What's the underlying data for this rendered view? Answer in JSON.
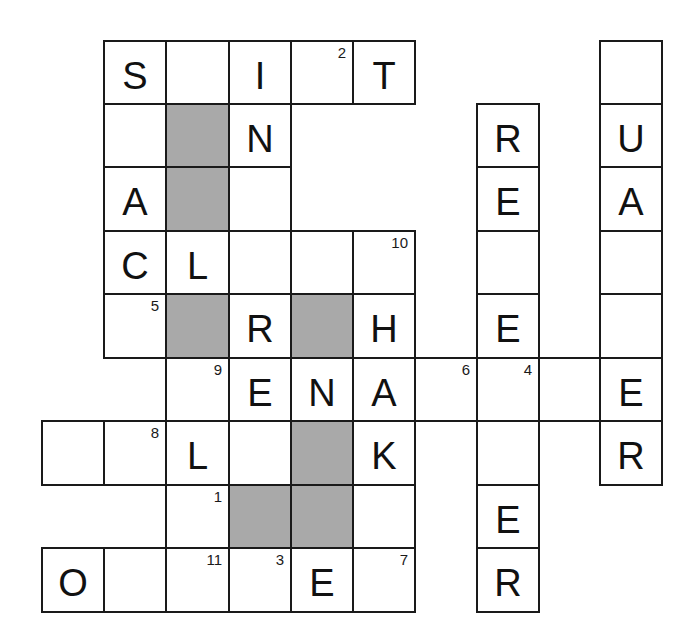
{
  "puzzle": {
    "type": "crossword",
    "grid_origin": {
      "x": 42,
      "y": 41
    },
    "cell_size": {
      "w": 62,
      "h": 63.4
    },
    "colors": {
      "block": "#a9a9a9",
      "line": "#1a1a1a",
      "background": "#ffffff"
    },
    "cells": [
      {
        "r": 0,
        "c": 1,
        "letter": "S",
        "num": ""
      },
      {
        "r": 0,
        "c": 2,
        "letter": "",
        "num": ""
      },
      {
        "r": 0,
        "c": 3,
        "letter": "I",
        "num": ""
      },
      {
        "r": 0,
        "c": 4,
        "letter": "",
        "num": "2"
      },
      {
        "r": 0,
        "c": 5,
        "letter": "T",
        "num": ""
      },
      {
        "r": 0,
        "c": 9,
        "letter": "",
        "num": ""
      },
      {
        "r": 1,
        "c": 1,
        "letter": "",
        "num": ""
      },
      {
        "r": 1,
        "c": 2,
        "block": true
      },
      {
        "r": 1,
        "c": 3,
        "letter": "N",
        "num": ""
      },
      {
        "r": 1,
        "c": 7,
        "letter": "R",
        "num": ""
      },
      {
        "r": 1,
        "c": 9,
        "letter": "U",
        "num": ""
      },
      {
        "r": 2,
        "c": 1,
        "letter": "A",
        "num": ""
      },
      {
        "r": 2,
        "c": 2,
        "block": true
      },
      {
        "r": 2,
        "c": 3,
        "letter": "",
        "num": ""
      },
      {
        "r": 2,
        "c": 7,
        "letter": "E",
        "num": ""
      },
      {
        "r": 2,
        "c": 9,
        "letter": "A",
        "num": ""
      },
      {
        "r": 3,
        "c": 1,
        "letter": "C",
        "num": ""
      },
      {
        "r": 3,
        "c": 2,
        "letter": "L",
        "num": ""
      },
      {
        "r": 3,
        "c": 3,
        "letter": "",
        "num": ""
      },
      {
        "r": 3,
        "c": 4,
        "letter": "",
        "num": ""
      },
      {
        "r": 3,
        "c": 5,
        "letter": "",
        "num": "10"
      },
      {
        "r": 3,
        "c": 7,
        "letter": "",
        "num": ""
      },
      {
        "r": 3,
        "c": 9,
        "letter": "",
        "num": ""
      },
      {
        "r": 4,
        "c": 1,
        "letter": "",
        "num": "5"
      },
      {
        "r": 4,
        "c": 2,
        "block": true
      },
      {
        "r": 4,
        "c": 3,
        "letter": "R",
        "num": ""
      },
      {
        "r": 4,
        "c": 4,
        "block": true
      },
      {
        "r": 4,
        "c": 5,
        "letter": "H",
        "num": ""
      },
      {
        "r": 4,
        "c": 7,
        "letter": "E",
        "num": ""
      },
      {
        "r": 4,
        "c": 9,
        "letter": "",
        "num": ""
      },
      {
        "r": 5,
        "c": 2,
        "letter": "",
        "num": "9"
      },
      {
        "r": 5,
        "c": 3,
        "letter": "E",
        "num": ""
      },
      {
        "r": 5,
        "c": 4,
        "letter": "N",
        "num": ""
      },
      {
        "r": 5,
        "c": 5,
        "letter": "A",
        "num": ""
      },
      {
        "r": 5,
        "c": 6,
        "letter": "",
        "num": "6"
      },
      {
        "r": 5,
        "c": 7,
        "letter": "",
        "num": "4"
      },
      {
        "r": 5,
        "c": 8,
        "letter": "",
        "num": ""
      },
      {
        "r": 5,
        "c": 9,
        "letter": "E",
        "num": ""
      },
      {
        "r": 6,
        "c": 0,
        "letter": "",
        "num": ""
      },
      {
        "r": 6,
        "c": 1,
        "letter": "",
        "num": "8"
      },
      {
        "r": 6,
        "c": 2,
        "letter": "L",
        "num": ""
      },
      {
        "r": 6,
        "c": 3,
        "letter": "",
        "num": ""
      },
      {
        "r": 6,
        "c": 4,
        "block": true
      },
      {
        "r": 6,
        "c": 5,
        "letter": "K",
        "num": ""
      },
      {
        "r": 6,
        "c": 7,
        "letter": "",
        "num": ""
      },
      {
        "r": 6,
        "c": 9,
        "letter": "R",
        "num": ""
      },
      {
        "r": 7,
        "c": 2,
        "letter": "",
        "num": "1"
      },
      {
        "r": 7,
        "c": 3,
        "block": true
      },
      {
        "r": 7,
        "c": 4,
        "block": true
      },
      {
        "r": 7,
        "c": 5,
        "letter": "",
        "num": ""
      },
      {
        "r": 7,
        "c": 7,
        "letter": "E",
        "num": ""
      },
      {
        "r": 8,
        "c": 0,
        "letter": "O",
        "num": ""
      },
      {
        "r": 8,
        "c": 1,
        "letter": "",
        "num": ""
      },
      {
        "r": 8,
        "c": 2,
        "letter": "",
        "num": "11"
      },
      {
        "r": 8,
        "c": 3,
        "letter": "",
        "num": "3"
      },
      {
        "r": 8,
        "c": 4,
        "letter": "E",
        "num": ""
      },
      {
        "r": 8,
        "c": 5,
        "letter": "",
        "num": "7"
      },
      {
        "r": 8,
        "c": 7,
        "letter": "R",
        "num": ""
      }
    ]
  }
}
